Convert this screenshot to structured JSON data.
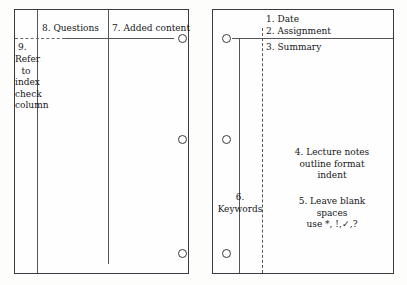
{
  "diagram": {
    "ink_color": "#16161a",
    "rule_color": "#55555c",
    "page_color": "#fefefe"
  },
  "left_page": {
    "name": "left-facing page",
    "labels": {
      "questions": "8. Questions",
      "added_content": "7. Added content",
      "index_number": "9.",
      "index_line1": "Refer to",
      "index_line2": "index",
      "index_line3": "check",
      "index_line4": "column"
    },
    "holes": [
      "hole-top",
      "hole-middle",
      "hole-bottom"
    ]
  },
  "right_page": {
    "name": "right-facing page",
    "labels": {
      "date": "1. Date",
      "assignment": "2. Assignment",
      "summary": "3. Summary",
      "lecture_line1": "4. Lecture notes",
      "lecture_line2": "outline format",
      "lecture_line3": "indent",
      "blank_line1": "5. Leave blank",
      "blank_line2": "spaces",
      "blank_line3": "use *, !,✓,?",
      "keywords_number": "6.",
      "keywords_label": "Keywords"
    },
    "holes": [
      "hole-top",
      "hole-middle",
      "hole-bottom"
    ]
  }
}
